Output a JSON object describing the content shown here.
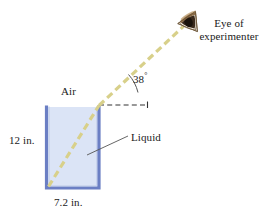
{
  "figure": {
    "labels": {
      "eye_line1": "Eye of",
      "eye_line2": "experimenter",
      "angle": "38",
      "angle_unit": "°",
      "air": "Air",
      "liquid": "Liquid",
      "height": "12 in.",
      "width": "7.2 in."
    },
    "colors": {
      "liquid_fill": "#dbe4f6",
      "container_wall": "#6b7fc4",
      "ray": "#d8d08a",
      "dashed_line": "#333333",
      "arc": "#555555",
      "leader_line": "#555555",
      "eye_dark": "#3a2a1c",
      "eye_mid": "#8a6a45",
      "eye_light": "#c9ad85"
    },
    "geometry": {
      "container_left": 45,
      "container_right": 100,
      "container_top": 105,
      "container_bottom": 189,
      "refraction_point_x": 99,
      "refraction_point_y": 105,
      "ray_origin_x": 48,
      "ray_origin_y": 187,
      "eye_x": 188,
      "eye_y": 20,
      "incident_angle_deg": 38
    }
  }
}
